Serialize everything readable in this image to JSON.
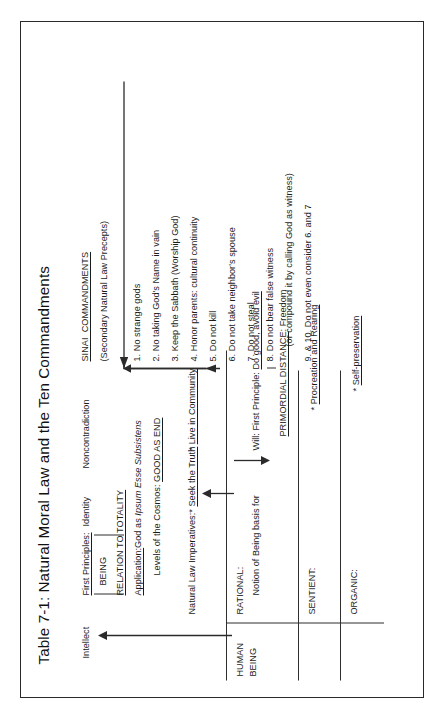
{
  "figure": {
    "title": "Table 7-1: Natural Moral Law and the Ten Commandments",
    "orientation": "rotated-90-ccw"
  },
  "left_column": {
    "faculty_intellect": "Intellect",
    "faculty_will_line": "Will: First Principle: ",
    "faculty_will_principle": "Do good, avoid evil",
    "first_principles_label": "First Principles:",
    "principle_identity": "Identity",
    "principle_noncontradiction": "Noncontradiction",
    "being_label": "BEING",
    "relation_to_totality": "RELATION TO TOTALITY",
    "application_label": "Application:",
    "application_text": "God as ",
    "application_italic": "Ipsum Esse Subsistens",
    "levels_label": "Levels of the Cosmos: ",
    "levels_value": "GOOD AS END",
    "imperatives_label": "Natural Law Imperatives:",
    "imperative_1_star": "* ",
    "imperative_1": "Seek the Truth",
    "imperative_2_star": "* ",
    "imperative_2": "Live in Community",
    "primordial_label": "PRIMORDIAL DISTANCE",
    "primordial_value": ": Freedom",
    "sentient_imperative_star": "* ",
    "sentient_imperative": "Procreation and Rearing",
    "organic_imperative_star": "* ",
    "organic_imperative": "Self-preservation"
  },
  "levels_column": {
    "human_being_line1": "HUMAN",
    "human_being_line2": "BEING",
    "rational_label": "RATIONAL:",
    "rational_text": "Notion of Being basis for",
    "sentient_label": "SENTIENT:",
    "organic_label": "ORGANIC:"
  },
  "right_column": {
    "heading": "SINAI  COMMANDMENTS",
    "subheading": "(Secondary Natural Law Precepts)",
    "commandments": [
      "1. No strange gods",
      "2. No taking God's Name in vain",
      "3. Keep the Sabbath (Worship God)",
      "4. Honor parents: cultural continuity",
      "5. Do not kill",
      "6. Do not take neighbor's spouse",
      "7. Do not steal",
      "8. Do not bear false witness",
      "(or compound it by calling God as witness)",
      "9. & 10. Do not even consider 6. and 7"
    ]
  },
  "colors": {
    "ink": "#1c1c1c",
    "rule": "#2f2f2f",
    "frame": "#2a2a2a",
    "background": "#ffffff"
  }
}
